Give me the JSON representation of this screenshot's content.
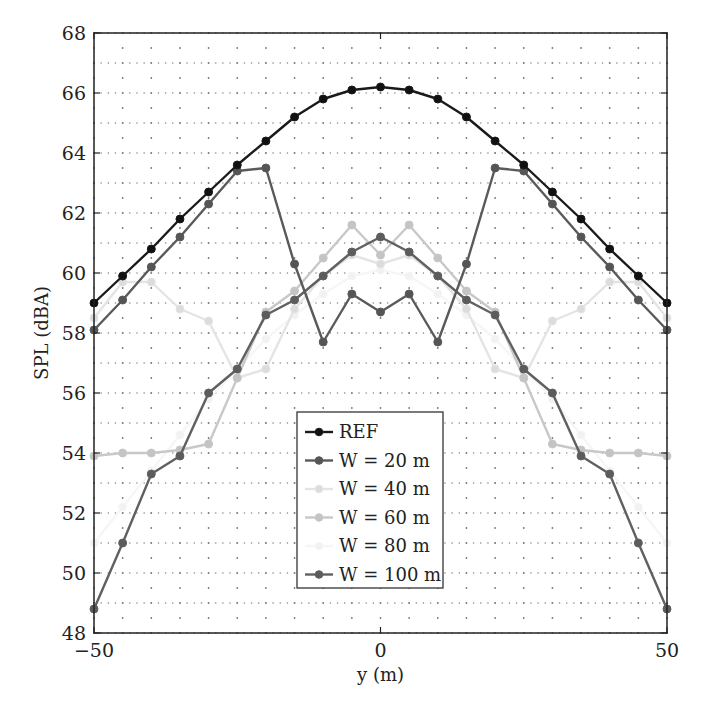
{
  "chart_data": {
    "type": "line",
    "title": "",
    "xlabel": "y (m)",
    "ylabel": "SPL (dBA)",
    "xlim": [
      -50,
      50
    ],
    "ylim": [
      48,
      68
    ],
    "xticks": [
      -50,
      0,
      50
    ],
    "xtick_labels": [
      "−50",
      "0",
      "50"
    ],
    "yticks": [
      48,
      50,
      52,
      54,
      56,
      58,
      60,
      62,
      64,
      66,
      68
    ],
    "grid": "dotted",
    "legend_position": "lower center",
    "x": [
      -50,
      -45,
      -40,
      -35,
      -30,
      -25,
      -20,
      -15,
      -10,
      -5,
      0,
      5,
      10,
      15,
      20,
      25,
      30,
      35,
      40,
      45,
      50
    ],
    "series": [
      {
        "name": "REF",
        "color": "#1a1a1a",
        "marker_color": "#111111",
        "values": [
          59.0,
          59.9,
          60.8,
          61.8,
          62.7,
          63.6,
          64.4,
          65.2,
          65.8,
          66.1,
          66.2,
          66.1,
          65.8,
          65.2,
          64.4,
          63.6,
          62.7,
          61.8,
          60.8,
          59.9,
          59.0
        ]
      },
      {
        "name": "W = 20 m",
        "color": "#5a5a5a",
        "marker_color": "#555555",
        "values": [
          58.1,
          59.1,
          60.2,
          61.2,
          62.3,
          63.4,
          63.5,
          60.3,
          57.7,
          59.3,
          58.7,
          59.3,
          57.7,
          60.3,
          63.5,
          63.4,
          62.3,
          61.2,
          60.2,
          59.1,
          58.1
        ]
      },
      {
        "name": "W = 40 m",
        "color": "#e4e4e4",
        "marker_color": "#dcdcdc",
        "values": [
          58.5,
          59.7,
          59.7,
          58.8,
          58.4,
          56.5,
          56.8,
          58.8,
          59.9,
          60.6,
          60.3,
          60.6,
          59.9,
          58.8,
          56.8,
          56.5,
          58.4,
          58.8,
          59.7,
          59.7,
          58.5
        ]
      },
      {
        "name": "W = 60 m",
        "color": "#c8c8c8",
        "marker_color": "#c4c4c4",
        "values": [
          53.9,
          54.0,
          54.0,
          54.1,
          54.3,
          56.5,
          58.7,
          59.4,
          60.5,
          61.6,
          60.6,
          61.6,
          60.5,
          59.4,
          58.7,
          56.5,
          54.3,
          54.1,
          54.0,
          54.0,
          53.9
        ]
      },
      {
        "name": "W = 80 m",
        "color": "#f6f6f6",
        "marker_color": "#f2f2f2",
        "values": [
          51.0,
          52.2,
          53.4,
          54.6,
          55.8,
          56.8,
          57.8,
          58.6,
          59.3,
          59.9,
          60.1,
          59.9,
          59.3,
          58.6,
          57.8,
          56.8,
          55.8,
          54.6,
          53.4,
          52.2,
          51.0
        ]
      },
      {
        "name": "W = 100 m",
        "color": "#606060",
        "marker_color": "#5c5c5c",
        "values": [
          48.8,
          51.0,
          53.3,
          53.9,
          56.0,
          56.8,
          58.6,
          59.1,
          59.9,
          60.7,
          61.2,
          60.7,
          59.9,
          59.1,
          58.6,
          56.8,
          56.0,
          53.9,
          53.3,
          51.0,
          48.8
        ]
      }
    ]
  }
}
